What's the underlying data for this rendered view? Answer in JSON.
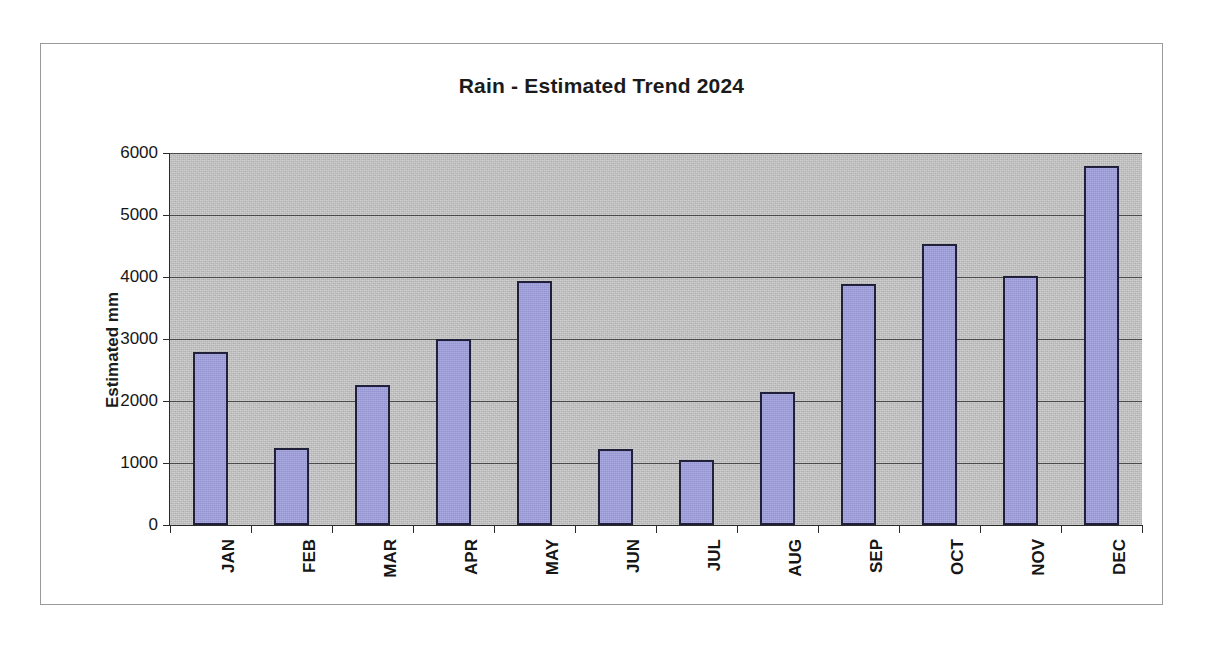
{
  "chart_data": {
    "type": "bar",
    "title": "Rain - Estimated Trend 2024",
    "xlabel": "",
    "ylabel": "Estimated mm",
    "categories": [
      "JAN",
      "FEB",
      "MAR",
      "APR",
      "MAY",
      "JUN",
      "JUL",
      "AUG",
      "SEP",
      "OCT",
      "NOV",
      "DEC"
    ],
    "values": [
      2790,
      1250,
      2260,
      3000,
      3940,
      1230,
      1050,
      2150,
      3880,
      4530,
      4010,
      5790
    ],
    "ylim": [
      0,
      6000
    ],
    "yticks": [
      0,
      1000,
      2000,
      3000,
      4000,
      5000,
      6000
    ],
    "ytick_labels": [
      "0",
      "1000",
      "2000",
      "3000",
      "4000",
      "5000",
      "6000"
    ],
    "grid": true,
    "legend": false,
    "legend_position": "none",
    "series": [
      {
        "name": "Estimated mm",
        "values": [
          2790,
          1250,
          2260,
          3000,
          3940,
          1230,
          1050,
          2150,
          3880,
          4530,
          4010,
          5790
        ]
      }
    ]
  },
  "style": {
    "bar_fill": "#9a9ad9",
    "bar_border": "#20203a",
    "plot_background": "#bdbdbd",
    "gridline_color": "#4a4a4a",
    "axis_color": "#2b2b2b",
    "text_color": "#161616",
    "page_background": "#ffffff",
    "frame_border": "#9a9a9a"
  }
}
